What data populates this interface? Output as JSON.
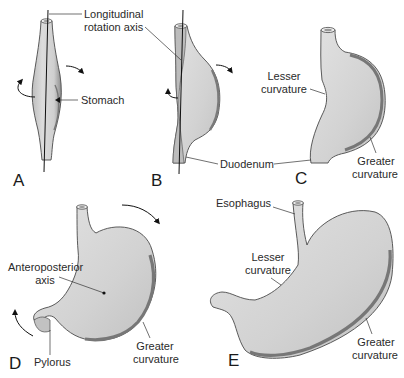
{
  "figure": {
    "panels": [
      {
        "id": "A",
        "label": "A"
      },
      {
        "id": "B",
        "label": "B"
      },
      {
        "id": "C",
        "label": "C"
      },
      {
        "id": "D",
        "label": "D"
      },
      {
        "id": "E",
        "label": "E"
      }
    ],
    "labels": {
      "longitudinal_axis_1": "Longitudinal",
      "longitudinal_axis_2": "rotation axis",
      "stomach": "Stomach",
      "duodenum": "Duodenum",
      "c_lesser_1": "Lesser",
      "c_lesser_2": "curvature",
      "c_greater_1": "Greater",
      "c_greater_2": "curvature",
      "d_ap_axis_1": "Anteroposterior",
      "d_ap_axis_2": "axis",
      "d_pylorus": "Pylorus",
      "d_greater_1": "Greater",
      "d_greater_2": "curvature",
      "e_esophagus": "Esophagus",
      "e_lesser_1": "Lesser",
      "e_lesser_2": "curvature",
      "e_greater_1": "Greater",
      "e_greater_2": "curvature"
    },
    "colors": {
      "organ_fill": "#d4d4d4",
      "organ_shadow": "#8a8a8a",
      "outline": "#4a4a4a",
      "text": "#2a2a2a",
      "background": "#ffffff"
    }
  }
}
